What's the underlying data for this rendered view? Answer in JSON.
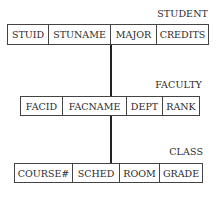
{
  "diagram": {
    "type": "hierarchical record structure",
    "records": [
      {
        "name": "STUDENT",
        "fields": [
          "STUID",
          "STUNAME",
          "MAJOR",
          "CREDITS"
        ]
      },
      {
        "name": "FACULTY",
        "fields": [
          "FACID",
          "FACNAME",
          "DEPT",
          "RANK"
        ]
      },
      {
        "name": "CLASS",
        "fields": [
          "COURSE#",
          "SCHED",
          "ROOM",
          "GRADE"
        ]
      }
    ],
    "links": [
      {
        "from": "STUDENT",
        "to": "FACULTY"
      },
      {
        "from": "FACULTY",
        "to": "CLASS"
      }
    ]
  }
}
